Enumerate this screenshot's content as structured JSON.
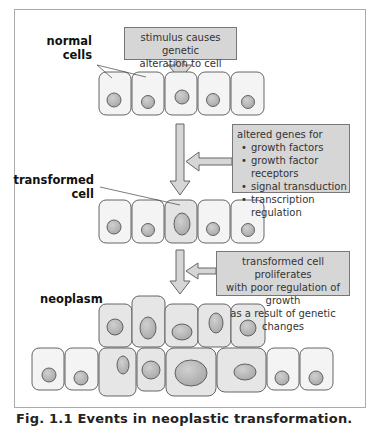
{
  "figure": {
    "caption": "Fig. 1.1 Events in neoplastic transformation.",
    "stages": [
      {
        "label_line1": "normal",
        "label_line2": "cells"
      },
      {
        "label_line1": "transformed",
        "label_line2": "cell"
      },
      {
        "label_line1": "neoplasm",
        "label_line2": ""
      }
    ],
    "boxes": {
      "stimulus": {
        "line1": "stimulus causes genetic",
        "line2": "alteration to cell"
      },
      "altered_genes": {
        "heading": "altered genes for",
        "items": [
          "growth factors",
          "growth factor receptors",
          "signal transduction",
          "transcription regulation"
        ]
      },
      "proliferation": {
        "line1": "transformed cell proliferates",
        "line2": "with poor regulation of growth",
        "line3": "as a result of genetic changes"
      }
    },
    "colors": {
      "box_fill": "#d6d6d6",
      "normal_cell_fill": "#f4f4f4",
      "transformed_cell_fill": "#e4e4e4",
      "nucleus_fill": "#b5b5b5",
      "outline": "#555555"
    }
  }
}
